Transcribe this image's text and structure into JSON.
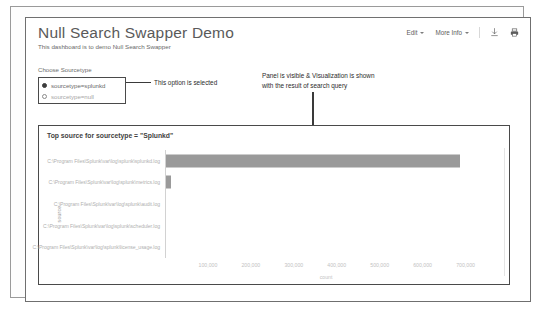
{
  "dashboard": {
    "title": "Null Search Swapper Demo",
    "subtitle": "This dashboard is to demo Null Search Swapper"
  },
  "header_controls": {
    "edit_label": "Edit",
    "more_info_label": "More Info",
    "export_icon": "download-icon",
    "print_icon": "print-icon"
  },
  "input_panel": {
    "choose_label": "Choose Sourcetype",
    "options": [
      {
        "label": "sourcetype=splunkd",
        "selected": true
      },
      {
        "label": "sourcetype=null",
        "selected": false
      }
    ]
  },
  "annotations": {
    "option_selected": "This option is selected",
    "panel_line1": "Panel is visible & Visualization is shown",
    "panel_line2": "with the result of search query"
  },
  "panel": {
    "title": "Top source for sourcetype = \"Splunkd\""
  },
  "chart_data": {
    "type": "bar",
    "orientation": "horizontal",
    "title": "Top source for sourcetype = \"Splunkd\"",
    "xlabel": "count",
    "ylabel": "source",
    "categories": [
      "C:\\Program Files\\Splunk\\var\\log\\splunk\\splunkd.log",
      "C:\\Program Files\\Splunk\\var\\log\\splunk\\metrics.log",
      "C:\\Program Files\\Splunk\\var\\log\\splunk\\audit.log",
      "C:\\Program Files\\Splunk\\var\\log\\splunk\\scheduler.log",
      "C:\\Program Files\\Splunk\\var\\log\\splunk\\license_usage.log"
    ],
    "values": [
      688000,
      9000,
      0,
      0,
      0
    ],
    "xlim": [
      0,
      750000
    ],
    "xticks": [
      100000,
      200000,
      300000,
      400000,
      500000,
      600000,
      700000
    ],
    "xticklabels": [
      "100,000",
      "200,000",
      "300,000",
      "400,000",
      "500,000",
      "600,000",
      "700,000"
    ],
    "grid": false,
    "legend": false,
    "bar_color": "#9a9a9a"
  }
}
